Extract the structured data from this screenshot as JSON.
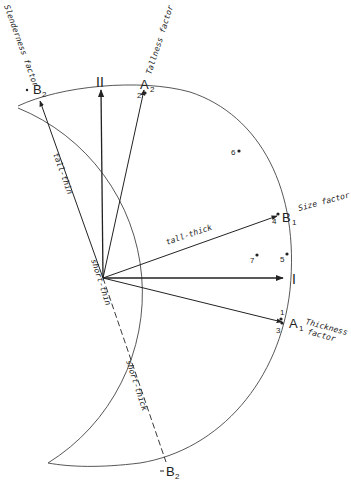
{
  "diagram": {
    "axes": {
      "axis_I": "I",
      "axis_II": "II"
    },
    "vectors": {
      "A1": {
        "label": "A",
        "subscript": "1",
        "factor": [
          "Thickness",
          "factor"
        ]
      },
      "A2": {
        "label": "A",
        "subscript": "2",
        "factor": "Tallness factor"
      },
      "B1": {
        "label": "B",
        "subscript": "1",
        "factor": "Size factor"
      },
      "B2_top": {
        "label": "B",
        "subscript": "2",
        "factor": "Slenderness factor"
      },
      "B2_bottom": {
        "label": "B",
        "subscript": "2"
      }
    },
    "line_labels": {
      "tall_thin": "tall-thin",
      "tall_thick": "tall-thick",
      "short_thin": "short-thin",
      "short_thick": "short-thick"
    },
    "points": [
      {
        "id": "1",
        "label": "1"
      },
      {
        "id": "2",
        "label": "2"
      },
      {
        "id": "3",
        "label": "3"
      },
      {
        "id": "4",
        "label": "4"
      },
      {
        "id": "5",
        "label": "5"
      },
      {
        "id": "6",
        "label": "6"
      },
      {
        "id": "7",
        "label": "7"
      }
    ],
    "colors": {
      "ink": "#222222",
      "background": "#ffffff"
    }
  }
}
